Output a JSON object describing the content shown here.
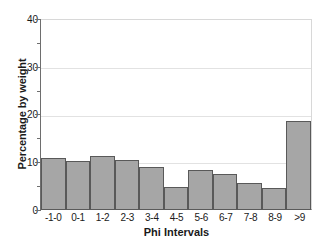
{
  "chart_data": {
    "type": "bar",
    "title": "",
    "xlabel": "Phi Intervals",
    "ylabel": "Percentage by weight",
    "categories": [
      "-1-0",
      "0-1",
      "1-2",
      "2-3",
      "3-4",
      "4-5",
      "5-6",
      "6-7",
      "7-8",
      "8-9",
      ">9"
    ],
    "values": [
      10.7,
      10.1,
      11.2,
      10.3,
      8.9,
      4.7,
      8.3,
      7.5,
      5.6,
      4.4,
      18.7
    ],
    "ylim": [
      0,
      40
    ],
    "yticks": [
      0,
      10,
      20,
      30,
      40
    ],
    "ytick_labels": [
      "0",
      "10",
      "20",
      "30",
      "40"
    ],
    "yticks_minor": [
      5,
      15,
      25,
      35
    ],
    "grid": true,
    "grid_axis": "y",
    "legend": false,
    "legend_position": "none",
    "bar_fill_color": "#a6a6a6",
    "bar_edge_color": "#595959",
    "grid_color": "#e2e2e2",
    "axis_color": "#5a5a5a",
    "text_color": "#1a1a1a",
    "background_color": "#ffffff"
  }
}
